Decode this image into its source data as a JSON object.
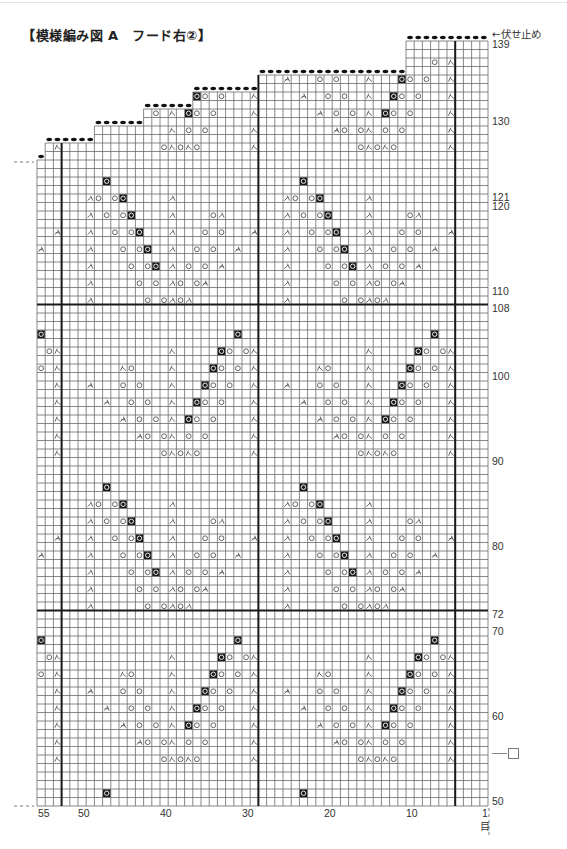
{
  "title": "【模様編み図 A　フード右②】",
  "bindoff_label": "←伏せ止め",
  "legend": {
    "symbol": "knit-stitch-box",
    "label": "□"
  },
  "grid": {
    "cols": 55,
    "first_row": 50,
    "last_row": 139,
    "right_x": 488,
    "bottom_y": 806,
    "cell_w": 8.2,
    "cell_h": 8.5,
    "thick_cols_after": [
      4,
      28,
      52
    ],
    "thick_rows_after": [
      72,
      108
    ]
  },
  "step_tops": [
    {
      "from_col": 1,
      "to_col": 10,
      "top_row": 139
    },
    {
      "from_col": 11,
      "to_col": 28,
      "top_row": 135
    },
    {
      "from_col": 29,
      "to_col": 36,
      "top_row": 133
    },
    {
      "from_col": 37,
      "to_col": 42,
      "top_row": 131
    },
    {
      "from_col": 43,
      "to_col": 48,
      "top_row": 129
    },
    {
      "from_col": 49,
      "to_col": 54,
      "top_row": 127
    },
    {
      "from_col": 55,
      "to_col": 55,
      "top_row": 125
    }
  ],
  "row_labels": [
    {
      "text": "139",
      "row": 139
    },
    {
      "text": "130",
      "row": 130
    },
    {
      "text": "121",
      "row": 121
    },
    {
      "text": "120",
      "row": 120
    },
    {
      "text": "110",
      "row": 110
    },
    {
      "text": "108",
      "row": 108
    },
    {
      "text": "100",
      "row": 100
    },
    {
      "text": "90",
      "row": 90
    },
    {
      "text": "80",
      "row": 80
    },
    {
      "text": "72",
      "row": 72
    },
    {
      "text": "70",
      "row": 70
    },
    {
      "text": "60",
      "row": 60
    },
    {
      "text": "50",
      "row": 50
    }
  ],
  "col_labels": [
    {
      "text": "55",
      "x": 38
    },
    {
      "text": "50",
      "x": 78
    },
    {
      "text": "40",
      "x": 160
    },
    {
      "text": "30",
      "x": 242
    },
    {
      "text": "20",
      "x": 324
    },
    {
      "text": "10",
      "x": 406
    },
    {
      "text": "1",
      "x": 482
    }
  ],
  "col_unit": "目",
  "symbols_legend": {
    "O": "yarn-over",
    "B": "yarn-over-black-cell",
    "L": "k2tog-left",
    "R": "ssk-right",
    "T": "sk2p-center"
  },
  "motif": {
    "period_rows": 36,
    "period_cols": 24,
    "base_rows": {
      "73": "L49 O42 O40 L39 O38 L37",
      "75": "L49 O43 O41 L39 O38 O36 T35",
      "77": "L49 O44 O42 B41 L39 O37 O35 T33",
      "79": "L49 O45 O43 B42 L39 O36 O34 T31",
      "81": "L49 O46 O44 B43 L39 O35 O33 T29",
      "83": "L49 O47 O45 B44 L39 O34 L33",
      "85": "L49 O48 O46 B45 L39",
      "87": "B47",
      "91": "R29 O40 R39 O38 R37 O36",
      "93": "T43 O42 O40 R39 O37 O35 R29",
      "95": "T45 O43 O41 R39 B37 O36 O34 R29",
      "97": "T47 O44 O42 R39 B36 O35 O33 R29",
      "99": "T49 O45 O43 R39 B35 O34 O32 R29",
      "101": "R45 O44 R39 B34 O33 O31 R29",
      "103": "R39 B33 O32 O30 R29",
      "105": "B31"
    },
    "exclude": [
      "137:10",
      "137:9",
      "139:*",
      "129:43",
      "129:42",
      "129:40"
    ]
  },
  "colors": {
    "grid_line": "#6a6a6a",
    "thick_line": "#1a1a1a",
    "symbol": "#555555",
    "black_cell": "#1a1a1a",
    "bindoff_dot": "#111111"
  }
}
